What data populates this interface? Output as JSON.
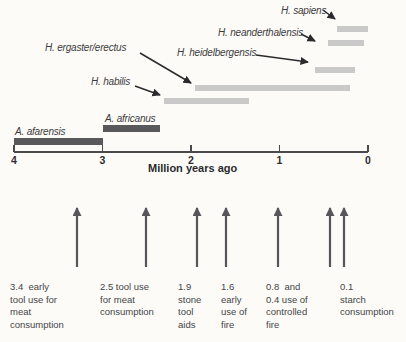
{
  "figure_name": "hominin-species-timeline",
  "chart_data": {
    "type": "bar",
    "subtype": "horizontal-timeline",
    "title": "",
    "xlabel": "Million years ago",
    "xlim": [
      4,
      0
    ],
    "x_ticks": [
      "4",
      "3",
      "2",
      "1",
      "0"
    ],
    "grid": false,
    "series": [
      {
        "name": "H. sapiens",
        "start_mya": 0.35,
        "end_mya": 0.0,
        "color_key": "light"
      },
      {
        "name": "H. neanderthalensis",
        "start_mya": 0.45,
        "end_mya": 0.05,
        "color_key": "light"
      },
      {
        "name": "H. heidelbergensis",
        "start_mya": 0.6,
        "end_mya": 0.15,
        "color_key": "light"
      },
      {
        "name": "H. ergaster/erectus",
        "start_mya": 1.95,
        "end_mya": 0.2,
        "color_key": "light"
      },
      {
        "name": "H. habilis",
        "start_mya": 2.3,
        "end_mya": 1.35,
        "color_key": "light"
      },
      {
        "name": "A. africanus",
        "start_mya": 3.0,
        "end_mya": 2.35,
        "color_key": "dark"
      },
      {
        "name": "A. afarensis",
        "start_mya": 4.0,
        "end_mya": 3.0,
        "color_key": "dark"
      }
    ],
    "event_arrow_values_mya": [
      3.4,
      2.5,
      1.9,
      1.6,
      0.8,
      0.4,
      0.1
    ],
    "events": [
      {
        "value_mya": 3.4,
        "label_lines": [
          "3.4  early",
          "tool use for",
          "meat",
          "consumption"
        ]
      },
      {
        "value_mya": 2.5,
        "label_lines": [
          "2.5 tool use",
          "for meat",
          "consumption"
        ]
      },
      {
        "value_mya": 1.9,
        "label_lines": [
          "1.9",
          "stone",
          "tool",
          "aids"
        ]
      },
      {
        "value_mya": 1.6,
        "label_lines": [
          "1.6",
          "early",
          "use of",
          "fire"
        ]
      },
      {
        "value_mya": [
          0.8,
          0.4
        ],
        "label_lines": [
          "0.8  and",
          "0.4 use of",
          "controlled",
          "fire"
        ]
      },
      {
        "value_mya": 0.1,
        "label_lines": [
          "0.1",
          "starch",
          "consumption"
        ]
      }
    ],
    "colors": {
      "light_bar": "#c9c9c9",
      "dark_bar": "#59595b",
      "leader_arrow": "#2b2b2d",
      "event_arrow": "#57575b",
      "axis": "#4a4a4c",
      "text": "#454547"
    }
  }
}
